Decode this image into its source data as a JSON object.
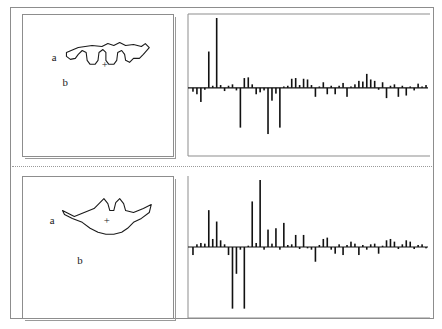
{
  "figure": {
    "background_color": "#ffffff",
    "frame_color": "#8d8d8d",
    "bar_color": "#111111",
    "outline_color": "#1a1a1a"
  },
  "panels": [
    {
      "id": "top",
      "shape": {
        "name": "triangular-outline-top",
        "label_a": "a",
        "label_b": "b",
        "centroid_marker": "+",
        "outline_path": "M 44,38 L 56,33 L 70,31 L 80,32 L 86,29 L 92,31 L 98,28 L 104,31 L 112,30 L 120,32 L 124,29 L 128,33 L 122,40 L 118,44 L 112,44 L 108,48 L 104,46 L 103,40 L 100,36 L 96,38 L 95,46 L 92,50 L 87,50 L 84,46 L 84,38 L 81,35 L 77,38 L 76,46 L 73,50 L 68,50 L 65,46 L 64,38 L 60,36 L 56,40 L 53,44 L 48,45 L 44,42 Z",
        "view_box": "0 0 152 143"
      },
      "chart": {
        "name": "fourier-coefficient-spectrum-top",
        "axis_color": "#8d8d8d",
        "baseline_ratio": 0.52,
        "values": [
          -0.06,
          -0.1,
          -0.22,
          -0.03,
          0.52,
          0.03,
          1.0,
          0.04,
          -0.05,
          0.03,
          0.05,
          -0.04,
          -0.62,
          0.14,
          0.15,
          0.05,
          -0.1,
          -0.07,
          -0.04,
          -0.72,
          -0.2,
          -0.09,
          -0.62,
          0.02,
          0.03,
          0.13,
          0.14,
          0.04,
          0.13,
          0.12,
          0.04,
          -0.14,
          0.02,
          0.08,
          -0.1,
          0.03,
          -0.1,
          0.03,
          0.07,
          -0.14,
          0.02,
          0.05,
          0.1,
          0.09,
          0.2,
          0.12,
          0.1,
          -0.03,
          0.08,
          -0.16,
          0.03,
          0.05,
          -0.14,
          0.03,
          -0.12,
          0.02,
          -0.04,
          0.06,
          0.02,
          0.04
        ]
      }
    },
    {
      "id": "bottom",
      "shape": {
        "name": "triangular-outline-bottom",
        "label_a": "a",
        "label_b": "b",
        "centroid_marker": "+",
        "outline_path": "M 40,34 L 52,40 L 62,36 L 72,32 L 78,26 L 82,22 L 86,27 L 88,34 L 92,34 L 94,26 L 98,22 L 102,27 L 104,34 L 112,36 L 122,32 L 130,28 L 128,36 L 120,42 L 112,46 L 106,52 L 100,56 L 92,58 L 84,58 L 76,56 L 68,52 L 60,46 L 50,42 L 42,38 Z",
        "view_box": "0 0 152 143"
      },
      "chart": {
        "name": "fourier-coefficient-spectrum-bottom",
        "axis_color": "#8d8d8d",
        "baseline_ratio": 0.5,
        "values": [
          -0.12,
          0.04,
          0.06,
          0.05,
          0.55,
          0.12,
          0.38,
          0.1,
          0.04,
          -0.12,
          -0.92,
          -0.4,
          -0.04,
          -0.92,
          0.02,
          0.68,
          0.06,
          1.0,
          -0.04,
          0.26,
          0.05,
          0.28,
          -0.04,
          0.36,
          0.03,
          0.04,
          0.18,
          -0.03,
          0.18,
          -0.02,
          -0.04,
          -0.22,
          0.03,
          0.12,
          0.14,
          -0.04,
          -0.1,
          0.04,
          -0.12,
          0.03,
          0.08,
          0.05,
          -0.12,
          0.03,
          -0.04,
          0.04,
          0.05,
          -0.1,
          0.02,
          0.1,
          0.12,
          0.08,
          -0.03,
          0.04,
          0.1,
          0.08,
          -0.03,
          0.03,
          0.04,
          -0.02
        ]
      }
    }
  ]
}
